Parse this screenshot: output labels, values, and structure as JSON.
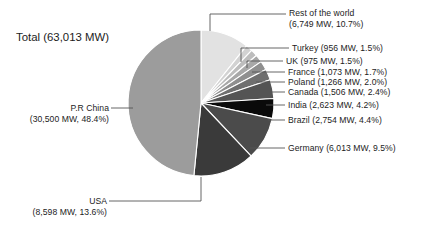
{
  "chart_data": {
    "type": "pie",
    "title": "Total (63,013 MW)",
    "total_label": "Total (63,013 MW)",
    "total_mw": 63013,
    "unit": "MW",
    "legend_position": "callout-labels",
    "grid": false,
    "categories": [
      "Rest of the world",
      "Turkey",
      "UK",
      "France",
      "Poland",
      "Canada",
      "India",
      "Brazil",
      "Germany",
      "USA",
      "P.R China"
    ],
    "values": [
      6749,
      956,
      975,
      1073,
      1266,
      1506,
      2623,
      2754,
      6013,
      8598,
      30500
    ],
    "percents": [
      10.7,
      1.5,
      1.5,
      1.7,
      2.0,
      2.4,
      4.2,
      4.4,
      9.5,
      13.6,
      48.4
    ],
    "colors": [
      "#e2e2e2",
      "#d2d2d2",
      "#bdbdbd",
      "#a8a8a8",
      "#8f8f8f",
      "#6f6f6f",
      "#545454",
      "#0a0a0a",
      "#4b4b4b",
      "#3a3a3a",
      "#9c9c9c"
    ],
    "slices": [
      {
        "name": "Rest of the world",
        "mw": 6749,
        "percent": 10.7,
        "label": "Rest of the world",
        "sub": "(6,749 MW, 10.7%)",
        "color": "#e2e2e2"
      },
      {
        "name": "Turkey",
        "mw": 956,
        "percent": 1.5,
        "label": "Turkey (956 MW, 1.5%)",
        "sub": "",
        "color": "#d2d2d2"
      },
      {
        "name": "UK",
        "mw": 975,
        "percent": 1.5,
        "label": "UK (975 MW, 1.5%)",
        "sub": "",
        "color": "#bdbdbd"
      },
      {
        "name": "France",
        "mw": 1073,
        "percent": 1.7,
        "label": "France (1,073 MW, 1.7%)",
        "sub": "",
        "color": "#a8a8a8"
      },
      {
        "name": "Poland",
        "mw": 1266,
        "percent": 2.0,
        "label": "Poland (1,266 MW, 2.0%)",
        "sub": "",
        "color": "#8f8f8f"
      },
      {
        "name": "Canada",
        "mw": 1506,
        "percent": 2.4,
        "label": "Canada (1,506 MW, 2.4%)",
        "sub": "",
        "color": "#6f6f6f"
      },
      {
        "name": "India",
        "mw": 2623,
        "percent": 4.2,
        "label": "India (2,623 MW, 4.2%)",
        "sub": "",
        "color": "#545454"
      },
      {
        "name": "Brazil",
        "mw": 2754,
        "percent": 4.4,
        "label": "Brazil (2,754 MW, 4.4%)",
        "sub": "",
        "color": "#0a0a0a"
      },
      {
        "name": "Germany",
        "mw": 6013,
        "percent": 9.5,
        "label": "Germany (6,013 MW, 9.5%)",
        "sub": "",
        "color": "#4b4b4b"
      },
      {
        "name": "USA",
        "mw": 8598,
        "percent": 13.6,
        "label": "USA",
        "sub": "(8,598 MW, 13.6%)",
        "color": "#3a3a3a"
      },
      {
        "name": "P.R China",
        "mw": 30500,
        "percent": 48.4,
        "label": "P.R China",
        "sub": "(30,500 MW, 48.4%)",
        "color": "#9c9c9c"
      }
    ]
  },
  "labels": {
    "total": "Total (63,013 MW)",
    "rest_of_world_l1": "Rest of the world",
    "rest_of_world_l2": "(6,749 MW, 10.7%)",
    "turkey": "Turkey (956 MW, 1.5%)",
    "uk": "UK (975 MW, 1.5%)",
    "france": "France (1,073 MW, 1.7%)",
    "poland": "Poland (1,266 MW, 2.0%)",
    "canada": "Canada (1,506 MW, 2.4%)",
    "india": "India (2,623 MW, 4.2%)",
    "brazil": "Brazil (2,754 MW, 4.4%)",
    "germany": "Germany (6,013 MW, 9.5%)",
    "usa_l1": "USA",
    "usa_l2": "(8,598 MW, 13.6%)",
    "china_l1": "P.R China",
    "china_l2": "(30,500 MW, 48.4%)"
  }
}
